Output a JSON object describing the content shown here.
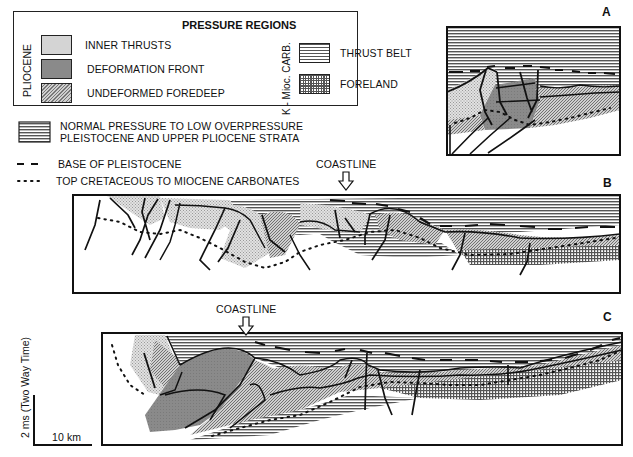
{
  "legend": {
    "title": "PRESSURE REGIONS",
    "groups": [
      {
        "label": "PLIOCENE",
        "items": [
          {
            "label": "INNER THRUSTS",
            "pattern": "light-stipple",
            "color": "#d4d4d4"
          },
          {
            "label": "DEFORMATION FRONT",
            "pattern": "dark-gray",
            "color": "#8a8a8a"
          },
          {
            "label": "UNDEFORMED FOREDEEP",
            "pattern": "crosshatch-fine",
            "color": "#b2b2b2"
          }
        ]
      },
      {
        "label": "K - Mioc. CARB.",
        "items": [
          {
            "label": "THRUST BELT",
            "pattern": "horizontal-lines",
            "color": "#c8c8c8"
          },
          {
            "label": "FORELAND",
            "pattern": "grid",
            "color": "#9a9a9a"
          }
        ]
      }
    ],
    "extra": [
      {
        "label_line1": "NORMAL PRESSURE TO LOW OVERPRESSURE",
        "label_line2": "PLEISTOCENE AND UPPER PLIOCENE STRATA",
        "pattern": "horizontal-lines"
      },
      {
        "label": "BASE OF PLEISTOCENE",
        "symbol": "dashed-line"
      },
      {
        "label": "TOP CRETACEOUS TO MIOCENE CARBONATES",
        "symbol": "dotted-line"
      }
    ]
  },
  "panels": [
    {
      "letter": "A"
    },
    {
      "letter": "B",
      "annotation": "COASTLINE"
    },
    {
      "letter": "C",
      "annotation": "COASTLINE"
    }
  ],
  "scale": {
    "vertical_label": "2 ms (Two Way Time)",
    "horizontal_label": "10 km"
  },
  "colors": {
    "line": "#111111",
    "inner_thrusts": "#d4d4d4",
    "deformation_front": "#8a8a8a",
    "foredeep": "#b2b2b2",
    "thrust_belt": "#c8c8c8",
    "foreland": "#9a9a9a"
  }
}
